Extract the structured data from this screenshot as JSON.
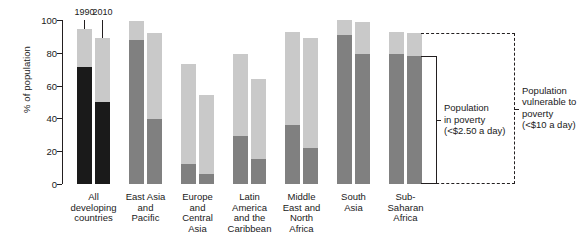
{
  "chart_data": {
    "type": "bar",
    "subtype": "stacked-grouped-bar",
    "title": "",
    "xlabel": "",
    "ylabel": "% of population",
    "ylim": [
      0,
      100
    ],
    "yticks": [
      0,
      20,
      40,
      60,
      80,
      100
    ],
    "grid": false,
    "legend_position": "right-annotations",
    "series_labels": [
      "1990",
      "2010"
    ],
    "stack_labels": [
      "Population in poverty (<$2.50 a day)",
      "Population vulnerable to poverty (<$10 a day)"
    ],
    "categories": [
      "All developing countries",
      "East Asia and Pacific",
      "Europe and Central Asia",
      "Latin America and the Caribbean",
      "Middle East and North Africa",
      "South Asia",
      "Sub-Saharan Africa"
    ],
    "series": [
      {
        "name": "1990",
        "poverty": [
          71.5,
          88.0,
          12.0,
          29.0,
          36.0,
          91.0,
          79.0
        ],
        "vulnerable_total": [
          94.5,
          99.5,
          73.0,
          79.0,
          93.0,
          100.0,
          93.0
        ],
        "error_high": [
          100.0,
          null,
          null,
          null,
          null,
          null,
          null
        ]
      },
      {
        "name": "2010",
        "poverty": [
          50.0,
          39.5,
          6.0,
          15.0,
          22.0,
          79.0,
          78.0
        ],
        "vulnerable_total": [
          89.0,
          92.0,
          54.0,
          64.0,
          89.0,
          99.0,
          92.0
        ],
        "error_high": [
          100.0,
          null,
          null,
          null,
          null,
          null,
          null
        ]
      }
    ],
    "colors": {
      "poverty_dark": "#1a1a1a",
      "poverty": "#808080",
      "vulnerable": "#c9c9c9",
      "axis": "#231f20",
      "background": "#ffffff"
    }
  },
  "axis": {
    "y_title": "% of population",
    "tick_labels": [
      "100",
      "80",
      "60",
      "40",
      "20",
      "0"
    ]
  },
  "year_markers": [
    {
      "label": "1990"
    },
    {
      "label": "2010"
    }
  ],
  "category_labels": [
    "All\ndeveloping\ncountries",
    "East Asia\nand\nPacific",
    "Europe\nand\nCentral\nAsia",
    "Latin\nAmerica\nand the\nCaribbean",
    "Middle\nEast and\nNorth\nAfrica",
    "South\nAsia",
    "Sub-\nSaharan\nAfrica"
  ],
  "annotations": {
    "poverty": "Population\nin poverty\n(<$2.50 a day)",
    "vulnerable": "Population\nvulnerable to\npoverty\n(<$10 a day)"
  }
}
